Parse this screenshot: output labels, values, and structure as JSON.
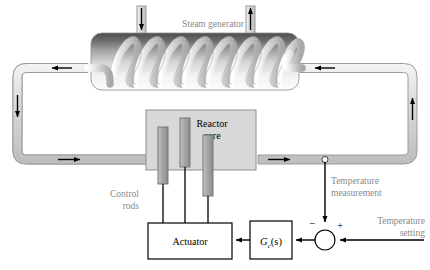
{
  "figure": {
    "type": "control-system-schematic",
    "background_color": "#ffffff"
  },
  "labels": {
    "steam_generator": "Steam generator",
    "reactor_core_line1": "Reactor",
    "reactor_core_line2": "core",
    "control_rods_line1": "Control",
    "control_rods_line2": "rods",
    "temperature_measurement_line1": "Temperature",
    "temperature_measurement_line2": "measurement",
    "temperature_setting_line1": "Temperature",
    "temperature_setting_line2": "setting",
    "actuator": "Actuator",
    "controller_G": "G",
    "controller_sub": "c",
    "controller_args": "(s)",
    "sum_minus": "−",
    "sum_plus": "+"
  },
  "colors": {
    "label_gray": "#8a8a8a",
    "text_black": "#000000",
    "pipe_fill": "#dcdcdc",
    "pipe_stroke": "#9a9a9a",
    "core_fill": "#d8d8d8",
    "core_stroke": "#8f8f8f",
    "rod_fill": "#a9a9a9",
    "rod_stroke": "#6f6f6f",
    "coil_fill": "#cfcfcf",
    "coil_stroke": "#8a8a8a",
    "generator_top": "#5a5a5a",
    "generator_bottom": "#fbfbfb",
    "line_black": "#000000"
  },
  "elements": {
    "coil_turns": 8,
    "control_rod_count": 3,
    "flow_arrows": [
      {
        "name": "top-left-pipe-arrow",
        "direction": "left"
      },
      {
        "name": "left-pipe-arrow",
        "direction": "down"
      },
      {
        "name": "bottom-left-pipe-arrow",
        "direction": "right"
      },
      {
        "name": "bottom-right-pipe-arrow",
        "direction": "right"
      },
      {
        "name": "right-pipe-arrow",
        "direction": "up"
      },
      {
        "name": "top-right-pipe-arrow",
        "direction": "left"
      },
      {
        "name": "feedwater-inlet-arrow",
        "direction": "down"
      },
      {
        "name": "steam-outlet-arrow",
        "direction": "up"
      }
    ]
  }
}
